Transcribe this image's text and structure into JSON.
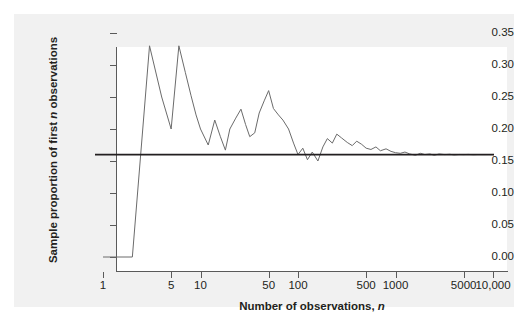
{
  "figure": {
    "background_color": "#ffffff",
    "panel_color": "#f1f1f1",
    "plot_color": "#ffffff",
    "axis_color": "#5a5a5a",
    "series_color": "#6b6b6b",
    "reference_color": "#231f20"
  },
  "labels": {
    "ylabel_prefix": "Sample proportion of first ",
    "ylabel_italic": "n",
    "ylabel_suffix": " observations",
    "xlabel_prefix": "Number of observations, ",
    "xlabel_italic": "n"
  },
  "chart_data": {
    "type": "line",
    "title": "",
    "subtitle": "",
    "xlabel": "Number of observations, n",
    "ylabel": "Sample proportion of first n observations",
    "xscale": "log",
    "yscale": "linear",
    "xlim": [
      1,
      10000
    ],
    "ylim": [
      0.0,
      0.35
    ],
    "grid": false,
    "legend": null,
    "ytick_labels": [
      "0.00",
      "0.05",
      "0.10",
      "0.15",
      "0.20",
      "0.25",
      "0.30",
      "0.35"
    ],
    "ytick_values": [
      0.0,
      0.05,
      0.1,
      0.15,
      0.2,
      0.25,
      0.3,
      0.35
    ],
    "xtick_labels": [
      "1",
      "5",
      "10",
      "50",
      "100",
      "500",
      "1000",
      "5000",
      "10,000"
    ],
    "xtick_values": [
      1,
      5,
      10,
      50,
      100,
      500,
      1000,
      5000,
      10000
    ],
    "annotations": [
      {
        "kind": "hline",
        "label": "true proportion",
        "y": 0.16
      }
    ],
    "series": [
      {
        "name": "Sample proportion of first n observations",
        "color": "#6b6b6b",
        "x": [
          1,
          2,
          3,
          4,
          5,
          6,
          7,
          8,
          9,
          10,
          12,
          14,
          16,
          18,
          20,
          23,
          26,
          29,
          32,
          36,
          40,
          45,
          50,
          56,
          63,
          70,
          80,
          90,
          100,
          112,
          125,
          140,
          160,
          180,
          200,
          225,
          250,
          280,
          320,
          360,
          400,
          450,
          500,
          560,
          630,
          700,
          800,
          900,
          1000,
          1120,
          1250,
          1400,
          1600,
          1800,
          2000,
          2250,
          2500,
          2800,
          3200,
          3600,
          4000,
          4500,
          5000,
          5600,
          6300,
          7000,
          8000,
          9000,
          10000
        ],
        "y": [
          0.0,
          0.0,
          0.33,
          0.25,
          0.2,
          0.33,
          0.288,
          0.252,
          0.222,
          0.2,
          0.175,
          0.214,
          0.188,
          0.167,
          0.2,
          0.217,
          0.231,
          0.207,
          0.188,
          0.194,
          0.225,
          0.244,
          0.26,
          0.232,
          0.222,
          0.214,
          0.2,
          0.178,
          0.16,
          0.17,
          0.152,
          0.164,
          0.15,
          0.172,
          0.185,
          0.178,
          0.192,
          0.186,
          0.179,
          0.174,
          0.181,
          0.176,
          0.17,
          0.168,
          0.172,
          0.166,
          0.169,
          0.165,
          0.163,
          0.162,
          0.164,
          0.161,
          0.159,
          0.162,
          0.16,
          0.161,
          0.159,
          0.161,
          0.16,
          0.1605,
          0.1595,
          0.1602,
          0.16,
          0.1603,
          0.1598,
          0.1601,
          0.16,
          0.1601,
          0.16
        ]
      }
    ]
  }
}
